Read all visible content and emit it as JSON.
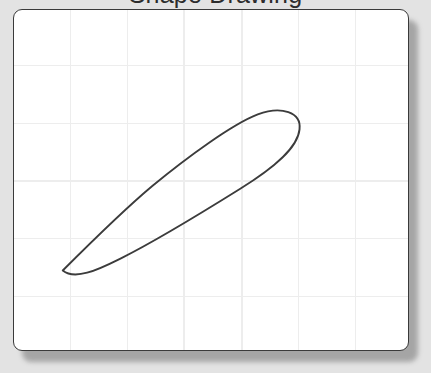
{
  "window": {
    "width": 431,
    "height": 373,
    "background_color": "#e3e3e3"
  },
  "header": {
    "title": "Shape Drawing",
    "title_clipped": true,
    "note": "title is cropped by the top edge of the screenshot; only letter descenders are visible"
  },
  "canvas_card": {
    "name": "drawing-canvas",
    "x": 13,
    "y": 9,
    "width": 396,
    "height": 342,
    "corner_radius": 9,
    "background_color": "#ffffff",
    "border_color": "#3a3a3a",
    "border_width": 1.5,
    "shadow_color": "#9b9b9b"
  },
  "grid": {
    "visible": true,
    "line_color": "#ededed",
    "line_width": 1.4,
    "spacing": 58,
    "vertical_x": [
      70,
      127,
      184,
      242,
      299,
      356
    ],
    "horizontal_y": [
      65,
      123,
      181,
      239,
      297
    ]
  },
  "shape": {
    "name": "closed-teardrop-curve",
    "type": "closed-freeform-path",
    "stroke_color": "#3c3c3c",
    "stroke_width": 1.9,
    "fill": "none",
    "description": "A closed spoon / teardrop outline: a narrow rounded tip at the lower-left that widens diagonally upward to a broad rounded bulb at the upper-right.",
    "tip_point": [
      60,
      272
    ],
    "bulb_center": [
      272,
      133
    ],
    "bulb_extent": [
      298,
      128
    ],
    "bounding_box": {
      "x": 57,
      "y": 108,
      "width": 245,
      "height": 172
    },
    "path_d": "M 62 270 C 58 276 62 281 70 279 C 88 275 112 257 136 234 C 156 215 172 203 190 191 C 214 175 244 153 262 137 C 278 123 292 117 298 126 C 304 136 296 148 280 160 C 258 177 228 195 202 210 C 178 224 158 236 142 244 C 122 255 100 264 86 268 C 74 271 66 266 62 270 Z",
    "outer_path_d": "M 62 271 C 88 245 122 211 152 186 C 186 158 232 124 258 114 C 282 105 302 112 300 129 C 298 148 274 168 240 189 C 200 214 152 243 120 259 C 96 271 74 281 62 271 Z"
  },
  "colors": {
    "background": "#e3e3e3",
    "card_background": "#ffffff",
    "card_border": "#3a3a3a",
    "grid": "#ededed",
    "shape_stroke": "#3c3c3c",
    "title_text": "#2c2c2c",
    "shadow": "#9b9b9b"
  }
}
